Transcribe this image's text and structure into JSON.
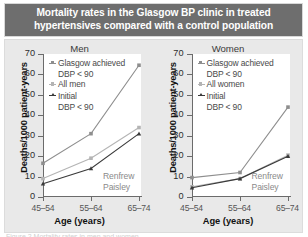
{
  "header": {
    "title": "Mortality rates in the Glasgow BP clinic in treated hypertensives compared with a control population"
  },
  "caption": "Figure 2  Mortality rates in men and women",
  "colors": {
    "header_bg": "#6e6e6e",
    "panel_bg": "#e9e9e9",
    "plot_bg": "#ffffff",
    "series_glasgow": "#8e8e8e",
    "series_all": "#b4b4b4",
    "series_initial": "#3a3a3a",
    "annotation": "#8a8a8a"
  },
  "axes": {
    "ylabel": "Deaths/1000 patient-years",
    "xlabel": "Age (years)",
    "yticks": [
      0,
      10,
      20,
      30,
      40,
      50,
      60,
      70
    ],
    "ylim": [
      0,
      70
    ],
    "xticks": [
      "45–54",
      "55–64",
      "65–74"
    ]
  },
  "annotation": {
    "line1": "Renfrew",
    "line2": "Paisley"
  },
  "legend_common": {
    "glasgow_line1": "Glasgow achieved",
    "glasgow_line2": "DBP < 90",
    "initial_line1": "Initial",
    "initial_line2": "DBP < 90"
  },
  "chart_data": [
    {
      "type": "line",
      "title": "Men",
      "xlabel": "Age (years)",
      "ylabel": "Deaths/1000 patient-years",
      "categories": [
        "45–54",
        "55–64",
        "65–74"
      ],
      "ylim": [
        0,
        70
      ],
      "grid": false,
      "legend_position": "top-left",
      "annotations": [
        "Renfrew",
        "Paisley"
      ],
      "series": [
        {
          "name": "Glasgow achieved DBP < 90",
          "values": [
            16.5,
            31.0,
            64.5
          ],
          "color": "#8e8e8e",
          "marker": "square"
        },
        {
          "name": "All men",
          "values": [
            9.0,
            19.0,
            34.0
          ],
          "color": "#b4b4b4",
          "marker": "square"
        },
        {
          "name": "Initial DBP < 90",
          "values": [
            6.5,
            14.0,
            31.0
          ],
          "color": "#3a3a3a",
          "marker": "triangle"
        }
      ]
    },
    {
      "type": "line",
      "title": "Women",
      "xlabel": "Age (years)",
      "ylabel": "Deaths/1000 patient-years",
      "categories": [
        "45–54",
        "55–64",
        "65–74"
      ],
      "ylim": [
        0,
        70
      ],
      "grid": false,
      "legend_position": "top-left",
      "annotations": [
        "Renfrew",
        "Paisley"
      ],
      "series": [
        {
          "name": "Glasgow achieved DBP < 90",
          "values": [
            9.5,
            12.0,
            44.0
          ],
          "color": "#8e8e8e",
          "marker": "square"
        },
        {
          "name": "All women",
          "values": [
            5.0,
            9.0,
            20.5
          ],
          "color": "#b4b4b4",
          "marker": "square"
        },
        {
          "name": "Initial DBP < 90",
          "values": [
            4.5,
            9.0,
            20.0
          ],
          "color": "#3a3a3a",
          "marker": "triangle"
        }
      ]
    }
  ],
  "panels": [
    {
      "title": "Men",
      "legend": [
        {
          "label1": "Glasgow achieved",
          "label2": "DBP < 90"
        },
        {
          "label1": "All men",
          "label2": ""
        },
        {
          "label1": "Initial",
          "label2": "DBP < 90"
        }
      ]
    },
    {
      "title": "Women",
      "legend": [
        {
          "label1": "Glasgow achieved",
          "label2": "DBP < 90"
        },
        {
          "label1": "All women",
          "label2": ""
        },
        {
          "label1": "Initial",
          "label2": "DBP < 90"
        }
      ]
    }
  ]
}
